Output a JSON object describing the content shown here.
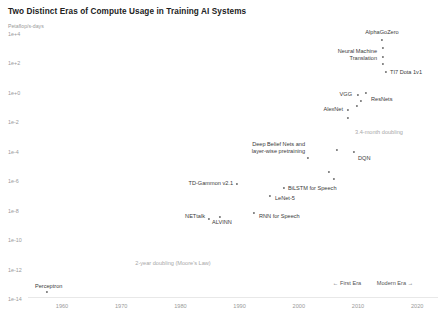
{
  "chart_data": {
    "type": "scatter",
    "title": "Two Distinct Eras of Compute Usage in Training AI Systems",
    "ylabel": "Petaflop/s-days",
    "xlabel": "",
    "ylim": [
      -15,
      5
    ],
    "xlim": [
      1955,
      2024
    ],
    "grid": false,
    "legend": null,
    "y_ticks": [
      "1e+4",
      "1e+2",
      "1e+0",
      "1e-2",
      "1e-4",
      "1e-6",
      "1e-8",
      "1e-10",
      "1e-12",
      "1e-14"
    ],
    "y_tick_values": [
      4,
      2,
      0,
      -2,
      -4,
      -6,
      -8,
      -10,
      -12,
      -14
    ],
    "x_ticks": [
      "1960",
      "1970",
      "1980",
      "1990",
      "2000",
      "2010",
      "2020"
    ],
    "x_tick_values": [
      1960,
      1970,
      1980,
      1990,
      2000,
      2010,
      2020
    ],
    "points": [
      {
        "name": "AlphaGoZero",
        "label": "AlphaGoZero",
        "x": 2017.6,
        "y": 3.4,
        "px": 382,
        "py": 40,
        "lx": 382,
        "ly": 32,
        "align": "c"
      },
      {
        "name": "unlabeled-1",
        "label": "",
        "x": 2017.4,
        "y": 2.8,
        "px": 383,
        "py": 48,
        "lx": 0,
        "ly": 0,
        "align": "c"
      },
      {
        "name": "neural-machine-translation",
        "label": "Neural Machine\nTranslation",
        "x": 2016.5,
        "y": 2.1,
        "px": 383,
        "py": 57,
        "lx": 377,
        "ly": 55,
        "align": "r"
      },
      {
        "name": "unlabeled-2",
        "label": "",
        "x": 2017.0,
        "y": 1.6,
        "px": 383,
        "py": 64,
        "lx": 0,
        "ly": 0,
        "align": "c"
      },
      {
        "name": "ti7-dota-1v1",
        "label": "TI7 Dota 1v1",
        "x": 2017.8,
        "y": 1.0,
        "px": 386,
        "py": 72,
        "lx": 390,
        "ly": 72,
        "align": "l"
      },
      {
        "name": "vgg",
        "label": "VGG",
        "x": 2014.6,
        "y": -0.5,
        "px": 358,
        "py": 95,
        "lx": 352,
        "ly": 94,
        "align": "r"
      },
      {
        "name": "resnets",
        "label": "ResNets",
        "x": 2015.6,
        "y": -0.4,
        "px": 366,
        "py": 93,
        "lx": 371,
        "ly": 99,
        "align": "l"
      },
      {
        "name": "unlabeled-3",
        "label": "",
        "x": 2015.0,
        "y": -0.9,
        "px": 361,
        "py": 101,
        "lx": 0,
        "ly": 0,
        "align": "c"
      },
      {
        "name": "alexnet",
        "label": "AlexNet",
        "x": 2012.4,
        "y": -1.4,
        "px": 348,
        "py": 110,
        "lx": 343,
        "ly": 109,
        "align": "r"
      },
      {
        "name": "unlabeled-4",
        "label": "",
        "x": 2013.4,
        "y": -1.2,
        "px": 357,
        "py": 106,
        "lx": 0,
        "ly": 0,
        "align": "c"
      },
      {
        "name": "unlabeled-5",
        "label": "",
        "x": 2011.8,
        "y": -2.1,
        "px": 348,
        "py": 118,
        "lx": 0,
        "ly": 0,
        "align": "c"
      },
      {
        "name": "dqn",
        "label": "DQN",
        "x": 2013.2,
        "y": -4.2,
        "px": 354,
        "py": 152,
        "lx": 358,
        "ly": 158,
        "align": "l"
      },
      {
        "name": "unlabeled-6",
        "label": "",
        "x": 2011.0,
        "y": -4.1,
        "px": 337,
        "py": 150,
        "lx": 0,
        "ly": 0,
        "align": "c"
      },
      {
        "name": "unlabeled-7",
        "label": "",
        "x": 2010.0,
        "y": -5.4,
        "px": 329,
        "py": 172,
        "lx": 0,
        "ly": 0,
        "align": "c"
      },
      {
        "name": "unlabeled-8",
        "label": "",
        "x": 2010.4,
        "y": -5.8,
        "px": 334,
        "py": 179,
        "lx": 0,
        "ly": 0,
        "align": "c"
      },
      {
        "name": "deep-belief-nets",
        "label": "Deep Belief Nets and\nlayer-wise pretraining",
        "x": 2006.5,
        "y": -4.6,
        "px": 308,
        "py": 158,
        "lx": 305,
        "ly": 148,
        "align": "r"
      },
      {
        "name": "bilstm-for-speech",
        "label": "BiLSTM for Speech",
        "x": 2001.5,
        "y": -6.4,
        "px": 284,
        "py": 188,
        "lx": 288,
        "ly": 188,
        "align": "l"
      },
      {
        "name": "lenet-5",
        "label": "LeNet-5",
        "x": 1998.5,
        "y": -6.9,
        "px": 270,
        "py": 196,
        "lx": 275,
        "ly": 198,
        "align": "l"
      },
      {
        "name": "td-gammon-v2.1",
        "label": "TD-Gammon v2.1",
        "x": 1992.5,
        "y": -6.5,
        "px": 237,
        "py": 184,
        "lx": 233,
        "ly": 183,
        "align": "r"
      },
      {
        "name": "rnn-for-speech",
        "label": "RNN for Speech",
        "x": 1996.0,
        "y": -8.2,
        "px": 254,
        "py": 213,
        "lx": 259,
        "ly": 216,
        "align": "l"
      },
      {
        "name": "nettalk",
        "label": "NETtalk",
        "x": 1987.0,
        "y": -8.4,
        "px": 209,
        "py": 219,
        "lx": 205,
        "ly": 216,
        "align": "r"
      },
      {
        "name": "alvinn",
        "label": "ALVINN",
        "x": 1989.0,
        "y": -8.2,
        "px": 220,
        "py": 217,
        "lx": 222,
        "ly": 222,
        "align": "c"
      },
      {
        "name": "perceptron",
        "label": "Perceptron",
        "x": 1959.0,
        "y": -14.2,
        "px": 47,
        "py": 292,
        "lx": 35,
        "ly": 286,
        "align": "l"
      }
    ],
    "annotations": [
      {
        "name": "doubling-3-4-month",
        "text": "3.4-month doubling",
        "px": 379,
        "py": 132,
        "align": "c"
      },
      {
        "name": "doubling-2-year",
        "text": "2-year doubling (Moore's Law)",
        "px": 173,
        "py": 263,
        "align": "c"
      }
    ],
    "era_labels": [
      {
        "name": "first-era",
        "text": "← First Era",
        "px": 347,
        "py": 283
      },
      {
        "name": "modern-era",
        "text": "Modern Era →",
        "px": 395,
        "py": 283
      }
    ],
    "colors": {
      "dot": "#6f6f6f",
      "label": "#3a3a3a",
      "annotation": "#a8a8a8",
      "tick": "#9a9a9a",
      "axis": "#e8e8e8",
      "background": "#ffffff"
    }
  }
}
